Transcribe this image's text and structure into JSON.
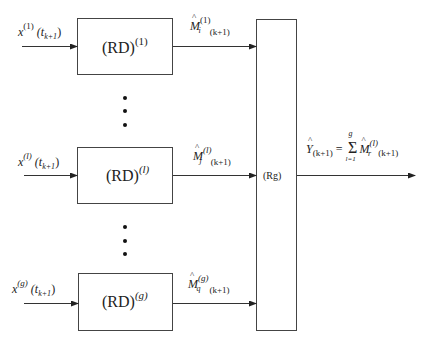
{
  "diagram": {
    "blocks": [
      {
        "id": "rd1",
        "label": "(RD)",
        "superscript": "(1)",
        "input": {
          "var": "x",
          "sup": "(1)",
          "arg": "(t",
          "arg_sub": "k+1",
          "arg_close": ")"
        },
        "output": {
          "var": "M",
          "sup": "(1)",
          "sub": "i",
          "index": "(k+1)"
        }
      },
      {
        "id": "rdl",
        "label": "(RD)",
        "superscript": "(l)",
        "input": {
          "var": "x",
          "sup": "(l)",
          "arg": "(t",
          "arg_sub": "k+1",
          "arg_close": ")"
        },
        "output": {
          "var": "M",
          "sup": "(l)",
          "sub": "j",
          "index": "(k+1)"
        }
      },
      {
        "id": "rdg",
        "label": "(RD)",
        "superscript": "(g)",
        "input": {
          "var": "x",
          "sup": "(g)",
          "arg": "(t",
          "arg_sub": "k+1",
          "arg_close": ")"
        },
        "output": {
          "var": "M",
          "sup": "(g)",
          "sub": "q",
          "index": "(k+1)"
        }
      }
    ],
    "aggregator": {
      "label": "(Rg)"
    },
    "output": {
      "var": "Y",
      "sub": "(k+1)",
      "eq": "=",
      "sum": "Σ",
      "sum_top": "g",
      "sum_bottom": "l=1",
      "term": "M",
      "term_sup": "(l)",
      "term_sub": "r",
      "term_index": "(k+1)"
    },
    "ellipsis": "⋮"
  }
}
